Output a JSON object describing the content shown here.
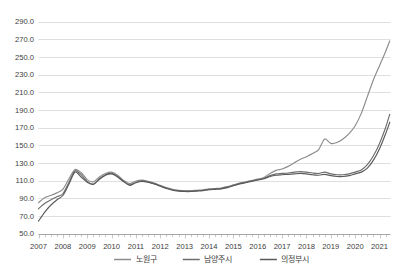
{
  "chart_data": {
    "type": "line",
    "title": "",
    "subtitle": "",
    "xlabel": "",
    "ylabel": "",
    "ylim": [
      50.0,
      290.0
    ],
    "ytick_step": 20.0,
    "ytick_labels": [
      "290.0",
      "270.0",
      "250.0",
      "230.0",
      "210.0",
      "190.0",
      "170.0",
      "150.0",
      "130.0",
      "110.0",
      "90.0",
      "70.0",
      "50.0"
    ],
    "ytick_values": [
      290.0,
      270.0,
      250.0,
      230.0,
      210.0,
      190.0,
      170.0,
      150.0,
      130.0,
      110.0,
      90.0,
      70.0,
      50.0
    ],
    "xlim": [
      2007.0,
      2021.45
    ],
    "xtick_labels": [
      "2007",
      "2008",
      "2009",
      "2010",
      "2011",
      "2012",
      "2013",
      "2014",
      "2015",
      "2016",
      "2017",
      "2018",
      "2019",
      "2020",
      "2021"
    ],
    "xtick_values": [
      2007,
      2008,
      2009,
      2010,
      2011,
      2012,
      2013,
      2014,
      2015,
      2016,
      2017,
      2018,
      2019,
      2020,
      2021
    ],
    "minor_ticks_per_year": 4,
    "grid": true,
    "grid_axis": "y",
    "legend_position": "bottom",
    "x": [
      2007.0,
      2007.25,
      2007.5,
      2007.75,
      2008.0,
      2008.25,
      2008.5,
      2008.75,
      2009.0,
      2009.25,
      2009.5,
      2009.75,
      2010.0,
      2010.25,
      2010.5,
      2010.75,
      2011.0,
      2011.25,
      2011.5,
      2011.75,
      2012.0,
      2012.25,
      2012.5,
      2012.75,
      2013.0,
      2013.25,
      2013.5,
      2013.75,
      2014.0,
      2014.25,
      2014.5,
      2014.75,
      2015.0,
      2015.25,
      2015.5,
      2015.75,
      2016.0,
      2016.25,
      2016.5,
      2016.75,
      2017.0,
      2017.25,
      2017.5,
      2017.75,
      2018.0,
      2018.25,
      2018.5,
      2018.75,
      2019.0,
      2019.25,
      2019.5,
      2019.75,
      2020.0,
      2020.25,
      2020.5,
      2020.75,
      2021.0,
      2021.25,
      2021.42
    ],
    "series": [
      {
        "name": "노원구",
        "color": "#8c8c8c",
        "values": [
          85.0,
          90.5,
          93.0,
          96.0,
          100.0,
          112.0,
          122.5,
          119.0,
          111.0,
          108.5,
          114.0,
          118.0,
          119.5,
          116.0,
          110.0,
          106.5,
          109.5,
          110.5,
          109.0,
          107.0,
          104.5,
          102.0,
          100.0,
          99.0,
          98.5,
          98.5,
          99.0,
          99.5,
          100.5,
          101.0,
          101.5,
          103.0,
          105.0,
          107.0,
          108.5,
          110.0,
          111.5,
          113.5,
          118.0,
          121.5,
          123.0,
          126.0,
          130.0,
          134.0,
          137.0,
          140.5,
          145.0,
          157.0,
          152.0,
          153.0,
          157.0,
          163.0,
          172.0,
          186.0,
          205.0,
          224.0,
          240.0,
          256.0,
          268.0
        ]
      },
      {
        "name": "남양주시",
        "color": "#6e6e6e",
        "values": [
          78.0,
          84.0,
          88.0,
          91.5,
          95.0,
          108.0,
          121.0,
          116.5,
          109.0,
          106.0,
          112.0,
          116.5,
          118.0,
          114.5,
          109.0,
          105.0,
          108.0,
          109.5,
          108.5,
          106.5,
          104.0,
          101.5,
          99.5,
          98.5,
          98.0,
          98.0,
          98.5,
          99.0,
          100.0,
          100.5,
          101.0,
          102.5,
          104.5,
          106.5,
          108.0,
          109.5,
          111.0,
          112.5,
          115.5,
          117.5,
          118.0,
          118.5,
          119.5,
          120.0,
          119.5,
          118.5,
          118.0,
          119.5,
          117.5,
          116.5,
          116.5,
          117.5,
          119.5,
          122.0,
          128.0,
          138.0,
          152.0,
          170.0,
          185.0
        ]
      },
      {
        "name": "의정부시",
        "color": "#5a5a5a",
        "values": [
          64.0,
          74.0,
          82.0,
          88.0,
          93.0,
          106.0,
          119.5,
          114.0,
          108.0,
          105.5,
          111.5,
          116.0,
          117.5,
          114.0,
          108.5,
          104.5,
          107.5,
          109.0,
          108.0,
          106.0,
          103.5,
          101.0,
          99.0,
          98.0,
          97.5,
          97.5,
          98.0,
          98.5,
          99.5,
          100.0,
          100.5,
          102.0,
          104.0,
          106.0,
          107.5,
          109.0,
          110.5,
          112.0,
          114.5,
          116.0,
          116.5,
          117.0,
          117.5,
          118.0,
          117.5,
          116.5,
          116.0,
          117.0,
          115.5,
          114.5,
          114.5,
          115.5,
          117.5,
          119.5,
          124.0,
          133.0,
          146.0,
          163.0,
          176.0
        ]
      }
    ]
  },
  "legend": {
    "items": [
      {
        "label": "노원구",
        "color": "#8c8c8c"
      },
      {
        "label": "남양주시",
        "color": "#6e6e6e"
      },
      {
        "label": "의정부시",
        "color": "#5a5a5a"
      }
    ]
  },
  "colors": {
    "background": "#ffffff",
    "gridline": "#c9c9c9",
    "axis": "#8f8f8f",
    "text": "#3d3d3d"
  }
}
